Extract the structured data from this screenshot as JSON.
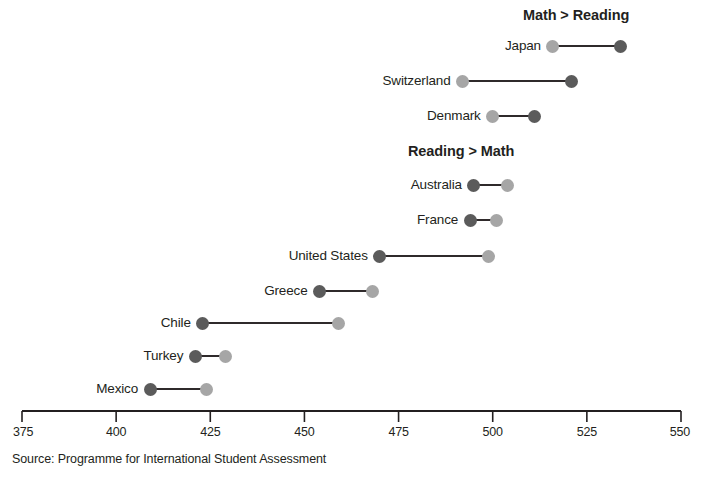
{
  "chart_data": {
    "type": "scatter",
    "subtype": "dumbbell",
    "title": "",
    "xlabel": "",
    "ylabel": "",
    "xlim": [
      375,
      550
    ],
    "xticks": [
      375,
      400,
      425,
      450,
      475,
      500,
      525,
      550
    ],
    "xtick_labels": [
      "375",
      "400",
      "425",
      "450",
      "475",
      "500",
      "525",
      "550"
    ],
    "grid": false,
    "legend_position": "none",
    "series": [
      {
        "name": "Math",
        "color": "#5b5b5b"
      },
      {
        "name": "Reading",
        "color": "#a6a6a6"
      }
    ],
    "sections": [
      {
        "heading": "Math > Reading",
        "rows": [
          {
            "label": "Japan",
            "reading": 516,
            "math": 534
          },
          {
            "label": "Switzerland",
            "reading": 492,
            "math": 521
          },
          {
            "label": "Denmark",
            "reading": 500,
            "math": 511
          }
        ]
      },
      {
        "heading": "Reading > Math",
        "rows": [
          {
            "label": "Australia",
            "math": 495,
            "reading": 504
          },
          {
            "label": "France",
            "math": 494,
            "reading": 501
          },
          {
            "label": "United States",
            "math": 470,
            "reading": 499
          },
          {
            "label": "Greece",
            "math": 454,
            "reading": 468
          },
          {
            "label": "Chile",
            "math": 423,
            "reading": 459
          },
          {
            "label": "Turkey",
            "math": 421,
            "reading": 429
          },
          {
            "label": "Mexico",
            "math": 409,
            "reading": 424
          }
        ]
      }
    ],
    "source": "Source: Programme for International Student Assessment"
  },
  "headings": {
    "math_greater": "Math > Reading",
    "reading_greater": "Reading > Math"
  },
  "source_note": "Source: Programme for International Student Assessment"
}
